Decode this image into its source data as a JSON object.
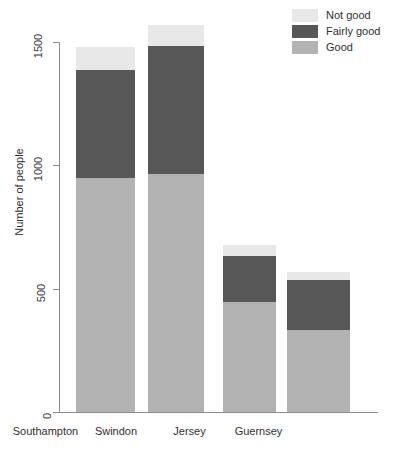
{
  "chart_data": {
    "type": "bar",
    "subtype": "stacked-bar",
    "title": "",
    "subtitle": "",
    "xlabel": "",
    "ylabel": "Number of people",
    "categories": [
      "Southampton",
      "Swindon",
      "Jersey",
      "Guernsey"
    ],
    "series": [
      {
        "name": "Good",
        "values": [
          949,
          965,
          446,
          332
        ],
        "color": "#b3b3b3"
      },
      {
        "name": "Fairly good",
        "values": [
          438,
          519,
          186,
          203
        ],
        "color": "#575757"
      },
      {
        "name": "Not good",
        "values": [
          92,
          85,
          45,
          32
        ],
        "color": "#e8e8e8"
      }
    ],
    "stack_totals": [
      1479,
      1569,
      677,
      567
    ],
    "ylim": [
      0,
      1600
    ],
    "yticks": [
      0,
      500,
      1000,
      1500
    ],
    "ytick_labels": [
      "0",
      "500",
      "1000",
      "1500"
    ],
    "grid": false,
    "legend_position": "top-right",
    "legend_order": [
      "Not good",
      "Fairly good",
      "Good"
    ],
    "axis_color": "#8d8d8d",
    "background": "#ffffff"
  },
  "legend": {
    "items": [
      {
        "label": "Not good",
        "color": "#e8e8e8"
      },
      {
        "label": "Fairly good",
        "color": "#575757"
      },
      {
        "label": "Good",
        "color": "#b3b3b3"
      }
    ]
  },
  "axes": {
    "y": {
      "title": "Number of people",
      "ticks": [
        "0",
        "500",
        "1000",
        "1500"
      ]
    },
    "x": {
      "ticks": [
        "Southampton",
        "Swindon",
        "Jersey",
        "Guernsey"
      ]
    }
  }
}
